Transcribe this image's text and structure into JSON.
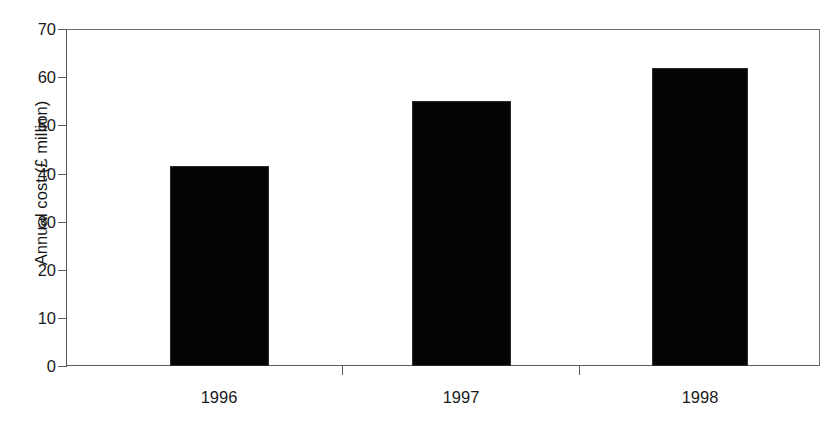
{
  "chart_data": {
    "type": "bar",
    "title": "",
    "subtitle": "",
    "xlabel": "",
    "ylabel": "Annual cost (£ million)",
    "categories": [
      "1996",
      "1997",
      "1998"
    ],
    "values": [
      41.5,
      55,
      62
    ],
    "series": [
      {
        "name": "Annual cost",
        "values": [
          41.5,
          55,
          62
        ],
        "color": "#050505"
      }
    ],
    "ylim": [
      0,
      70
    ],
    "yticks": [
      0,
      10,
      20,
      30,
      40,
      50,
      60,
      70
    ],
    "ytick_labels": [
      "0",
      "10",
      "20",
      "30",
      "40",
      "50",
      "60",
      "70"
    ],
    "grid": false,
    "legend": false,
    "legend_position": "none",
    "annotations": [],
    "axis_color": "#5a5a5a",
    "background_color": "#ffffff"
  }
}
